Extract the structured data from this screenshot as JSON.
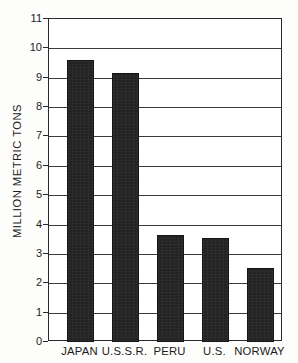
{
  "chart_data": {
    "type": "bar",
    "title": "",
    "subtitle": "",
    "xlabel": "",
    "ylabel": "MILLION METRIC TONS",
    "categories": [
      "JAPAN",
      "U.S.S.R.",
      "PERU",
      "U.S.",
      "NORWAY"
    ],
    "values": [
      9.6,
      9.15,
      3.65,
      3.55,
      2.53
    ],
    "series": [
      {
        "name": "",
        "values": [
          9.6,
          9.15,
          3.65,
          3.55,
          2.53
        ]
      }
    ],
    "ylim": [
      0,
      11
    ],
    "ytick_labels": [
      "11",
      "10",
      "9",
      "8",
      "7",
      "6",
      "5",
      "4",
      "3",
      "2",
      "1",
      "0"
    ],
    "ytick_values": [
      11,
      10,
      9,
      8,
      7,
      6,
      5,
      4,
      3,
      2,
      1,
      0
    ],
    "ytick_step": 1,
    "grid": true,
    "grid_axis": "y",
    "legend": false,
    "legend_position": "none",
    "bar_color": "#232323",
    "grid_color": "#3a3a3a",
    "axis_color": "#2a2a2a",
    "background_color": "#ffffff",
    "annotations": []
  },
  "figure": {
    "name": "fish-catch-bar-chart"
  }
}
